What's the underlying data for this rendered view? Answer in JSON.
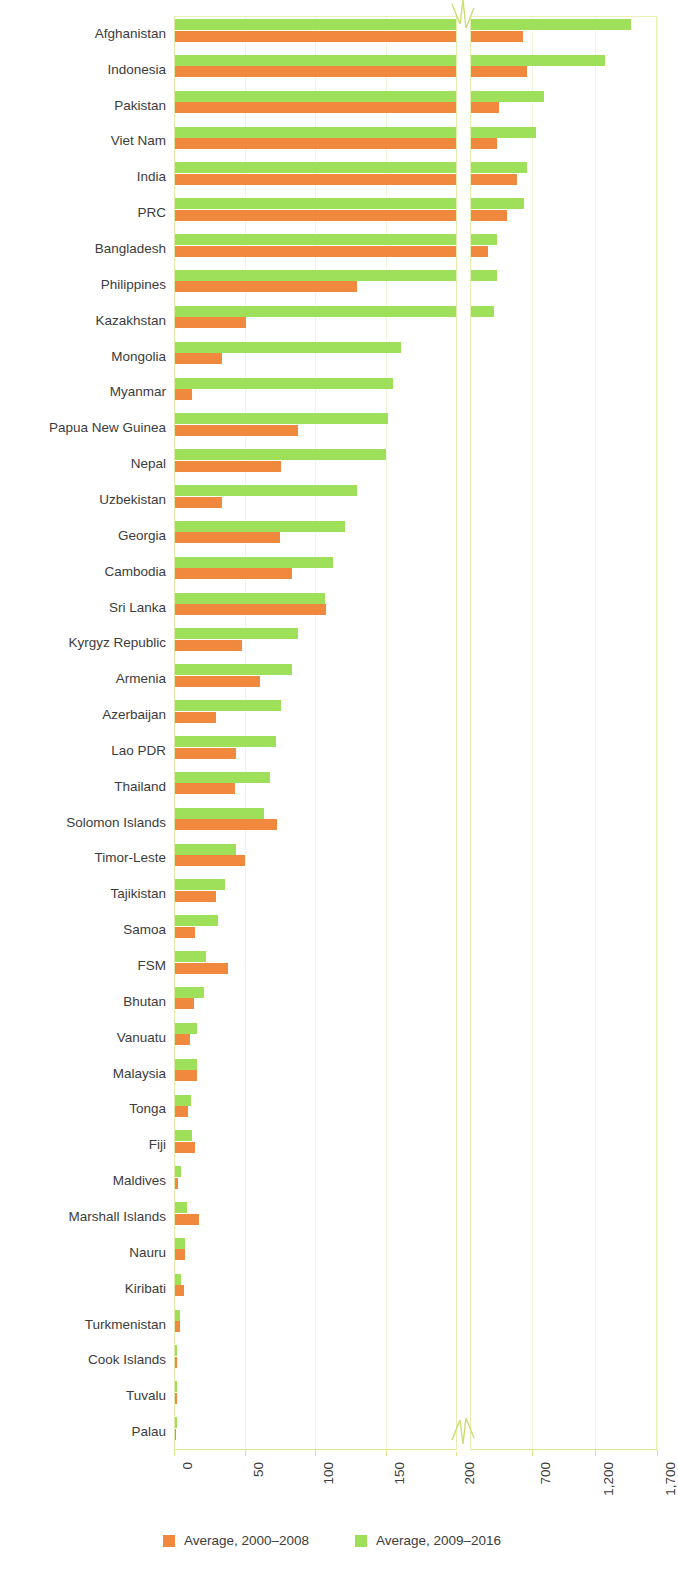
{
  "chart_data": {
    "type": "bar",
    "orientation": "horizontal",
    "title": "",
    "xlabel": "",
    "ylabel": "",
    "grid": true,
    "legend_position": "bottom",
    "axis_break": {
      "present": true,
      "after": 200,
      "resumes_at": 200
    },
    "xticks": [
      "0",
      "50",
      "100",
      "150",
      "200",
      "700",
      "1,200",
      "1,700"
    ],
    "xtick_values": [
      0,
      50,
      100,
      150,
      200,
      700,
      1200,
      1700
    ],
    "xlim_lower_panel": [
      0,
      200
    ],
    "xlim_upper_panel": [
      200,
      1700
    ],
    "colors": {
      "series_1": "#f0893e",
      "series_2": "#9fe05a",
      "grid": "#eef3d4",
      "axis": "#d9e88a",
      "text": "#3c3c3c"
    },
    "categories": [
      "Afghanistan",
      "Indonesia",
      "Pakistan",
      "Viet Nam",
      "India",
      "PRC",
      "Bangladesh",
      "Philippines",
      "Kazakhstan",
      "Mongolia",
      "Myanmar",
      "Papua New Guinea",
      "Nepal",
      "Uzbekistan",
      "Georgia",
      "Cambodia",
      "Sri Lanka",
      "Kyrgyz Republic",
      "Armenia",
      "Azerbaijan",
      "Lao PDR",
      "Thailand",
      "Solomon Islands",
      "Timor-Leste",
      "Tajikistan",
      "Samoa",
      "FSM",
      "Bhutan",
      "Vanuatu",
      "Malaysia",
      "Tonga",
      "Fiji",
      "Maldives",
      "Marshall Islands",
      "Nauru",
      "Kiribati",
      "Turkmenistan",
      "Cook Islands",
      "Tuvalu",
      "Palau"
    ],
    "series": [
      {
        "name": "Average, 2000–2008",
        "color": "#f0893e",
        "values": [
          625,
          655,
          435,
          420,
          580,
          495,
          345,
          130,
          51,
          34,
          13,
          88,
          76,
          34,
          75,
          84,
          108,
          48,
          61,
          30,
          44,
          43,
          73,
          50,
          30,
          15,
          38,
          14,
          11,
          16,
          10,
          15,
          3,
          18,
          8,
          7,
          4,
          2,
          2,
          1
        ]
      },
      {
        "name": "Average, 2009–2016",
        "color": "#9fe05a",
        "values": [
          1490,
          1285,
          790,
          730,
          660,
          635,
          420,
          420,
          395,
          161,
          155,
          152,
          150,
          130,
          121,
          113,
          107,
          88,
          84,
          76,
          72,
          68,
          64,
          44,
          36,
          31,
          23,
          21,
          16,
          16,
          12,
          13,
          5,
          9,
          8,
          5,
          4,
          2,
          2,
          2
        ]
      }
    ]
  },
  "legend": {
    "items": [
      {
        "label": "Average, 2000–2008",
        "color": "#f0893e"
      },
      {
        "label": "Average, 2009–2016",
        "color": "#9fe05a"
      }
    ]
  }
}
